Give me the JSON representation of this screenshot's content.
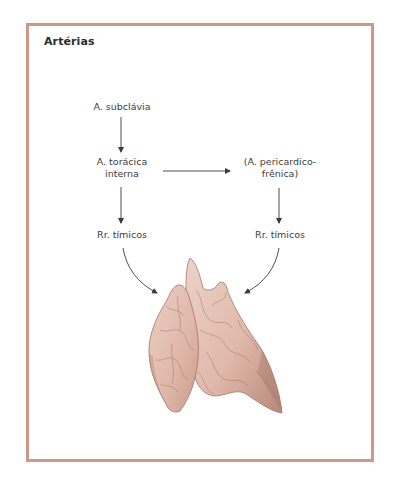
{
  "diagram": {
    "title": "Artérias",
    "nodes": {
      "subclavia": "A. subclávia",
      "toracica_line1": "A. torácica",
      "toracica_line2": "interna",
      "pericardico_line1": "(A. pericardico-",
      "pericardico_line2": "frênica)",
      "timicos_left": "Rr. tímicos",
      "timicos_right": "Rr. tímicos"
    },
    "edges": [
      {
        "from": "A. subclávia",
        "to": "A. torácica interna"
      },
      {
        "from": "A. torácica interna",
        "to": "(A. pericardico-frênica)"
      },
      {
        "from": "A. torácica interna",
        "to": "Rr. tímicos"
      },
      {
        "from": "(A. pericardico-frênica)",
        "to": "Rr. tímicos"
      },
      {
        "from": "Rr. tímicos",
        "to": "thymus"
      },
      {
        "from": "Rr. tímicos",
        "to": "thymus"
      }
    ],
    "illustration": "thymus-gland",
    "colors": {
      "frame_border": "#d39585",
      "arrow": "#3a3a3a",
      "thymus_fill": "#e3bcae",
      "thymus_shadow": "#b98a7c",
      "thymus_lines": "#9d6f63"
    }
  }
}
